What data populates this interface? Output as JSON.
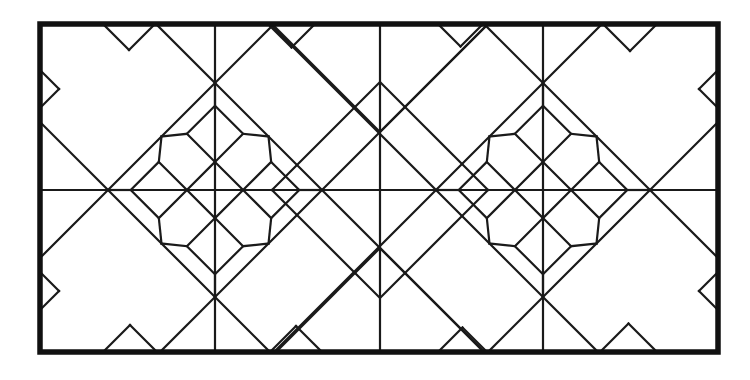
{
  "document": {
    "title": "Geometric Leaded-Glass Panel Pattern",
    "kind": "line-drawing",
    "description": "Black-line geometric tile / stained-glass panel layout composed of two mirrored diamond medallions inside a heavy rectangular border."
  },
  "canvas": {
    "width": 750,
    "height": 380,
    "background": "#ffffff"
  },
  "style": {
    "line_color": "#1a1a1a",
    "border_color": "#111111",
    "border_stroke": 5.5,
    "inner_stroke": 2.2,
    "line_cap": "round",
    "line_join": "miter"
  },
  "geometry": {
    "border": {
      "x1": 40,
      "y1": 24,
      "x2": 718,
      "y2": 352
    },
    "axes": {
      "horizontal_midline_y": 190,
      "center_vertical_x": 380,
      "left_vertical_x": 215,
      "right_vertical_x": 543
    },
    "medallions": [
      {
        "name": "left-medallion",
        "cx": 215,
        "cy": 190,
        "half_diagonal": 107
      },
      {
        "name": "right-medallion",
        "cx": 543,
        "cy": 190,
        "half_diagonal": 107
      }
    ],
    "small_diamonds": [
      {
        "name": "top-center-diamond",
        "cx": 380,
        "cy": 107,
        "half": 25
      },
      {
        "name": "bottom-center-diamond",
        "cx": 380,
        "cy": 273,
        "half": 25
      }
    ],
    "edge_nodes": {
      "top": [
        103,
        155,
        215,
        268,
        315,
        380,
        438,
        483,
        543,
        603,
        657
      ],
      "bottom": [
        103,
        157,
        215,
        270,
        322,
        380,
        438,
        487,
        543,
        600,
        657
      ],
      "left": [
        70,
        108,
        190,
        272,
        310
      ],
      "right": [
        70,
        108,
        190,
        272,
        310
      ]
    }
  },
  "segments": {
    "count_note": "All visible strokes are reconstructed procedurally from the geometry block.",
    "palette": [
      "#1a1a1a",
      "#ffffff"
    ]
  },
  "labels": {
    "none_present": "This image contains no text, numbers, axes, legends or UI chrome."
  }
}
